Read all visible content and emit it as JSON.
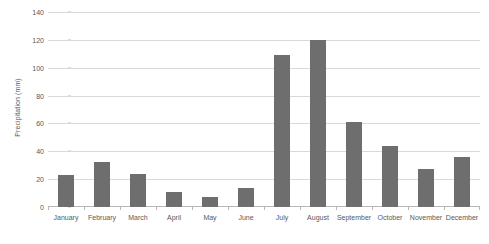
{
  "chart_data": {
    "type": "bar",
    "title": "",
    "xlabel": "",
    "ylabel": "Precipitation (mm)",
    "ylim": [
      0,
      140
    ],
    "ytick_labels": [
      "0",
      "20",
      "40",
      "60",
      "80",
      "100",
      "120",
      "140"
    ],
    "yticks": [
      0,
      20,
      40,
      60,
      80,
      100,
      120,
      140
    ],
    "grid": true,
    "legend": false,
    "bar_color": "#6e6e6e",
    "gridline_color": "#d9d9d9",
    "axis_color": "#b7b7b7",
    "text_color": "#595959",
    "categories": [
      "January",
      "February",
      "March",
      "April",
      "May",
      "June",
      "July",
      "August",
      "September",
      "October",
      "November",
      "December"
    ],
    "values": [
      23,
      32,
      24,
      11,
      7,
      14,
      109,
      120,
      61,
      44,
      27,
      36
    ]
  }
}
